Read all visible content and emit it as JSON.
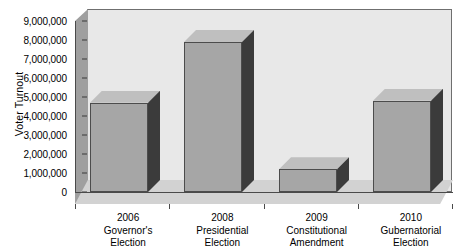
{
  "chart_data": {
    "type": "bar",
    "title": "",
    "xlabel": "",
    "ylabel": "Voter Turnout",
    "categories": [
      "2006 Governor's Election",
      "2008 Presidential Election",
      "2009 Constitutional Amendment",
      "2010 Gubernatorial Election"
    ],
    "category_lines": [
      [
        "2006",
        "Governor's",
        "Election"
      ],
      [
        "2008",
        "Presidential",
        "Election"
      ],
      [
        "2009",
        "Constitutional",
        "Amendment"
      ],
      [
        "2010",
        "Gubernatorial",
        "Election"
      ]
    ],
    "values": [
      4700000,
      7900000,
      1200000,
      4800000
    ],
    "ylim": [
      0,
      9000000
    ],
    "ytick_values": [
      0,
      1000000,
      2000000,
      3000000,
      4000000,
      5000000,
      6000000,
      7000000,
      8000000,
      9000000
    ],
    "ytick_labels": [
      "0",
      "1,000,000",
      "2,000,000",
      "3,000,000",
      "4,000,000",
      "5,000,000",
      "6,000,000",
      "7,000,000",
      "8,000,000",
      "9,000,000"
    ],
    "grid": false,
    "legend": null,
    "style": "3d-column",
    "colors": {
      "bar_front": "#a6a6a6",
      "bar_side": "#3b3b3b",
      "bar_top": "#bfbfbf",
      "plot_back_wall": "#e8e8e8",
      "plot_left_wall": "#9f9f9f",
      "plot_floor": "#d2d2d2",
      "axis": "#4a4a4a",
      "text": "#000000",
      "background": "#ffffff"
    }
  }
}
